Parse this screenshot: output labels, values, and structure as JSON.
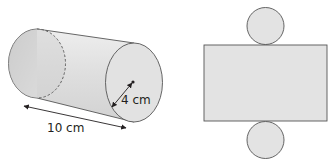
{
  "diagram": {
    "type": "cylinder-and-net",
    "cylinder": {
      "radius_label": "4 cm",
      "length_label": "10 cm"
    },
    "net": {
      "parts": [
        "top-circle",
        "rectangle",
        "bottom-circle"
      ]
    },
    "colors": {
      "fill": "#e6e6e6",
      "stroke": "#555555",
      "text": "#231f20"
    }
  }
}
